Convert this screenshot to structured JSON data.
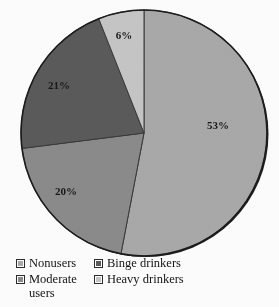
{
  "chart_data": {
    "type": "pie",
    "title": "",
    "subtitle": "",
    "xlabel": "",
    "ylabel": "",
    "grid": false,
    "legend_position": "bottom",
    "start_angle_deg": 0,
    "direction": "clockwise",
    "categories": [
      "Nonusers",
      "Moderate users",
      "Binge drinkers",
      "Heavy drinkers"
    ],
    "values": [
      53,
      20,
      21,
      6
    ],
    "value_unit": "%",
    "data_labels": [
      "53%",
      "20%",
      "21%",
      "6%"
    ],
    "colors": [
      "#a9a9a9",
      "#8b8b8b",
      "#5b5b5b",
      "#c6c6c6"
    ],
    "slices": [
      {
        "label": "Nonusers",
        "value": 53,
        "data_label": "53%",
        "color": "#a9a9a9",
        "start_deg": 0,
        "end_deg": 190.8,
        "label_x": 218,
        "label_y": 126
      },
      {
        "label": "Moderate users",
        "value": 20,
        "data_label": "20%",
        "color": "#8b8b8b",
        "start_deg": 190.8,
        "end_deg": 262.8,
        "label_x": 66,
        "label_y": 192
      },
      {
        "label": "Binge drinkers",
        "value": 21,
        "data_label": "21%",
        "color": "#5b5b5b",
        "start_deg": 262.8,
        "end_deg": 338.4,
        "label_x": 59,
        "label_y": 86
      },
      {
        "label": "Heavy drinkers",
        "value": 6,
        "data_label": "6%",
        "color": "#c6c6c6",
        "start_deg": 338.4,
        "end_deg": 360,
        "label_x": 124,
        "label_y": 36
      }
    ]
  },
  "pie": {
    "center_x": 144,
    "center_y": 133,
    "radius": 123,
    "outline_color": "#1c1c1c"
  },
  "labels": {
    "nonusers_pct": "53%",
    "moderate_pct": "20%",
    "binge_pct": "21%",
    "heavy_pct": "6%"
  },
  "legend": {
    "items": [
      {
        "label": "Nonusers",
        "color": "#a9a9a9"
      },
      {
        "label": "Binge drinkers",
        "color": "#5b5b5b"
      },
      {
        "label": "Moderate\nusers",
        "color": "#8b8b8b"
      },
      {
        "label": "Heavy drinkers",
        "color": "#c6c6c6"
      }
    ]
  }
}
